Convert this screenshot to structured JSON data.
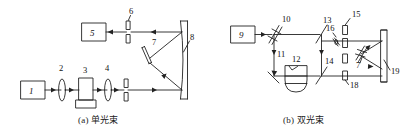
{
  "figure": {
    "background_color": "#ffffff",
    "line_color": "#222222",
    "text_color": "#111111"
  },
  "panels": [
    {
      "id": "panel-a",
      "caption": "(a) 单光束",
      "caption_label": "(a)",
      "caption_text": "单光束",
      "components": [
        {
          "num": "1",
          "name": "light-source-box",
          "type": "box"
        },
        {
          "num": "2",
          "name": "lens",
          "type": "lens"
        },
        {
          "num": "3",
          "name": "sample-cell",
          "type": "cell"
        },
        {
          "num": "4",
          "name": "lens",
          "type": "lens"
        },
        {
          "num": "5",
          "name": "detector-box",
          "type": "box"
        },
        {
          "num": "6",
          "name": "slit",
          "type": "slit"
        },
        {
          "num": "7",
          "name": "plane-mirror",
          "type": "mirror"
        },
        {
          "num": "8",
          "name": "concave-grating-mirror",
          "type": "concave-mirror"
        }
      ]
    },
    {
      "id": "panel-b",
      "caption": "(b) 双光束",
      "caption_label": "(b)",
      "caption_text": "双光束",
      "components": [
        {
          "num": "9",
          "name": "light-source-box",
          "type": "box"
        },
        {
          "num": "10",
          "name": "beam-splitter",
          "type": "splitter"
        },
        {
          "num": "11",
          "name": "mirror",
          "type": "mirror"
        },
        {
          "num": "12",
          "name": "sample-flask",
          "type": "flask"
        },
        {
          "num": "13",
          "name": "mirror",
          "type": "mirror"
        },
        {
          "num": "14",
          "name": "mirror",
          "type": "mirror"
        },
        {
          "num": "15",
          "name": "slit",
          "type": "slit"
        },
        {
          "num": "16",
          "name": "small-mirror",
          "type": "mirror"
        },
        {
          "num": "17",
          "name": "chopper",
          "type": "chopper"
        },
        {
          "num": "18",
          "name": "slit",
          "type": "slit"
        },
        {
          "num": "19",
          "name": "plane-mirror",
          "type": "mirror"
        }
      ]
    }
  ],
  "labels": {
    "n1": "1",
    "n2": "2",
    "n3": "3",
    "n4": "4",
    "n5": "5",
    "n6": "6",
    "n7": "7",
    "n8": "8",
    "n9": "9",
    "n10": "10",
    "n11": "11",
    "n12": "12",
    "n13": "13",
    "n14": "14",
    "n15": "15",
    "n16": "16",
    "n17": "7",
    "n18": "18",
    "n19": "19"
  }
}
